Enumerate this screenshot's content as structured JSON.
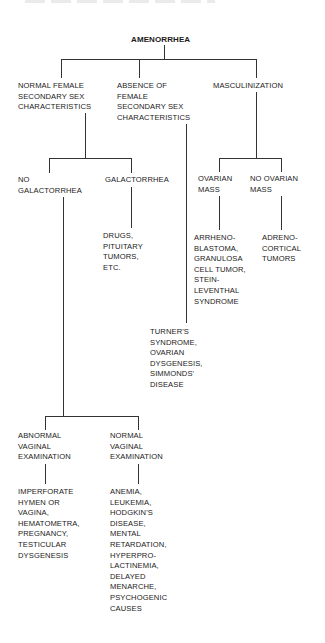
{
  "diagram": {
    "type": "decision-tree",
    "root": "AMENORRHEA",
    "nodes": {
      "root": "AMENORRHEA",
      "normal_female": "NORMAL FEMALE\nSECONDARY SEX\nCHARACTERISTICS",
      "absence_female": "ABSENCE OF\nFEMALE\nSECONDARY SEX\nCHARACTERISTICS",
      "masculinization": "MASCULINIZATION",
      "no_galactorrhea": "NO\nGALACTORRHEA",
      "galactorrhea": "GALACTORRHEA",
      "drugs": "DRUGS,\nPITUITARY\nTUMORS,\nETC.",
      "ovarian_mass": "OVARIAN\nMASS",
      "no_ovarian_mass": "NO OVARIAN\nMASS",
      "arrhenoblastoma": "ARRHENO-\nBLASTOMA,\nGRANULOSA\nCELL TUMOR,\nSTEIN-\nLEVENTHAL\nSYNDROME",
      "adrenocortical": "ADRENO-\nCORTICAL\nTUMORS",
      "turners": "TURNER'S\nSYNDROME,\nOVARIAN\nDYSGENESIS,\nSIMMONDS'\nDISEASE",
      "abnormal_vaginal": "ABNORMAL\nVAGINAL\nEXAMINATION",
      "normal_vaginal": "NORMAL\nVAGINAL\nEXAMINATION",
      "imperforate": "IMPERFORATE\nHYMEN OR\nVAGINA,\nHEMATOMETRA,\nPREGNANCY,\nTESTICULAR\nDYSGENESIS",
      "anemia": "ANEMIA,\nLEUKEMIA,\nHODGKIN'S\nDISEASE,\nMENTAL\nRETARDATION,\nHYPERPRO-\nLACTINEMIA,\nDELAYED\nMENARCHE,\nPSYCHOGENIC\nCAUSES"
    },
    "edges": [
      [
        "root",
        "normal_female"
      ],
      [
        "root",
        "absence_female"
      ],
      [
        "root",
        "masculinization"
      ],
      [
        "normal_female",
        "no_galactorrhea"
      ],
      [
        "normal_female",
        "galactorrhea"
      ],
      [
        "galactorrhea",
        "drugs"
      ],
      [
        "masculinization",
        "ovarian_mass"
      ],
      [
        "masculinization",
        "no_ovarian_mass"
      ],
      [
        "ovarian_mass",
        "arrhenoblastoma"
      ],
      [
        "no_ovarian_mass",
        "adrenocortical"
      ],
      [
        "absence_female",
        "turners"
      ],
      [
        "no_galactorrhea",
        "abnormal_vaginal"
      ],
      [
        "no_galactorrhea",
        "normal_vaginal"
      ],
      [
        "abnormal_vaginal",
        "imperforate"
      ],
      [
        "normal_vaginal",
        "anemia"
      ]
    ],
    "colors": {
      "line": "#333333",
      "text": "#1a1a1a",
      "background": "#ffffff"
    }
  }
}
